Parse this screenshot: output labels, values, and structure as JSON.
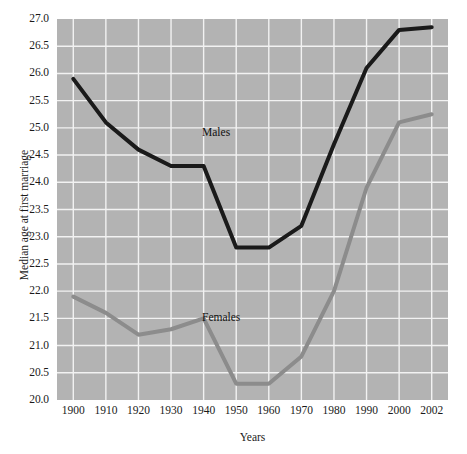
{
  "chart_data": {
    "type": "line",
    "title": "",
    "xlabel": "Years",
    "ylabel": "Median age at first marriage",
    "x": [
      1900,
      1910,
      1920,
      1930,
      1940,
      1950,
      1960,
      1970,
      1980,
      1990,
      2000,
      2002
    ],
    "categories": [
      "1900",
      "1910",
      "1920",
      "1930",
      "1940",
      "1950",
      "1960",
      "1970",
      "1980",
      "1990",
      "2000",
      "2002"
    ],
    "xlim": [
      1900,
      2002
    ],
    "ylim": [
      20.0,
      27.0
    ],
    "ytick_labels": [
      "27.0",
      "26.5",
      "26.0",
      "25.5",
      "25.0",
      "24.5",
      "24.0",
      "23.5",
      "23.0",
      "22.5",
      "22.0",
      "21.5",
      "21.0",
      "20.5",
      "20.0"
    ],
    "ytick_values": [
      27.0,
      26.5,
      26.0,
      25.5,
      25.0,
      24.5,
      24.0,
      23.5,
      23.0,
      22.5,
      22.0,
      21.5,
      21.0,
      20.5,
      20.0
    ],
    "grid": true,
    "grid_color": "#f2f2f2",
    "plot_background": "#b3b3b3",
    "legend_position": "inline-annotations",
    "series": [
      {
        "name": "Males",
        "color": "#1a1a1a",
        "line_width": 4,
        "values": [
          25.9,
          25.1,
          24.6,
          24.3,
          24.3,
          22.8,
          22.8,
          23.2,
          24.7,
          26.1,
          26.8,
          26.85
        ]
      },
      {
        "name": "Females",
        "color": "#8c8c8c",
        "line_width": 4,
        "values": [
          21.9,
          21.6,
          21.2,
          21.3,
          21.5,
          20.3,
          20.3,
          20.8,
          22.0,
          23.9,
          25.1,
          25.25
        ]
      }
    ],
    "annotations": [
      {
        "text": "Males",
        "x": 1924,
        "y": 25.35
      },
      {
        "text": "Females",
        "x": 1924,
        "y": 21.95
      }
    ]
  }
}
